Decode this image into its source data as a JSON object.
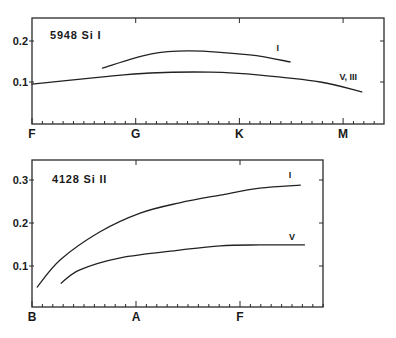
{
  "chart_data": [
    {
      "type": "line",
      "panel": "top",
      "title": "5948 Si I",
      "xlabel": "",
      "ylabel": "",
      "x_categories": [
        "F",
        "G",
        "K",
        "M"
      ],
      "x_minor_ticks_per_interval": 10,
      "xlim": [
        0,
        3.4
      ],
      "ylim": [
        0,
        0.25
      ],
      "y_ticks": [
        0.1,
        0.2
      ],
      "y_tick_labels": [
        "0.1",
        "0.2"
      ],
      "grid": false,
      "series": [
        {
          "name": "I",
          "label_position": {
            "x": 2.37,
            "y": 0.175
          },
          "x": [
            0.68,
            1.14,
            1.52,
            2.1,
            2.49
          ],
          "y": [
            0.134,
            0.168,
            0.176,
            0.166,
            0.149
          ]
        },
        {
          "name": "V, III",
          "label_position": {
            "x": 3.05,
            "y": 0.105
          },
          "x": [
            0.0,
            0.66,
            1.14,
            1.72,
            2.2,
            2.78,
            3.18
          ],
          "y": [
            0.095,
            0.112,
            0.122,
            0.124,
            0.117,
            0.1,
            0.076
          ]
        }
      ]
    },
    {
      "type": "line",
      "panel": "bottom",
      "title": "4128 Si II",
      "xlabel": "",
      "ylabel": "",
      "x_categories": [
        "B",
        "A",
        "F"
      ],
      "x_minor_ticks_per_interval": 10,
      "xlim": [
        0,
        2.83
      ],
      "ylim": [
        0,
        0.345
      ],
      "y_ticks": [
        0.1,
        0.2,
        0.3
      ],
      "y_tick_labels": [
        "0.1",
        "0.2",
        "0.3"
      ],
      "grid": false,
      "series": [
        {
          "name": "I",
          "label_position": {
            "x": 2.48,
            "y": 0.305
          },
          "x": [
            0.05,
            0.27,
            0.65,
            1.04,
            1.42,
            1.81,
            2.19,
            2.58
          ],
          "y": [
            0.051,
            0.114,
            0.179,
            0.223,
            0.247,
            0.265,
            0.281,
            0.288
          ]
        },
        {
          "name": "V",
          "label_position": {
            "x": 2.5,
            "y": 0.16
          },
          "x": [
            0.28,
            0.46,
            0.85,
            1.42,
            1.81,
            2.19,
            2.62
          ],
          "y": [
            0.06,
            0.091,
            0.119,
            0.137,
            0.147,
            0.149,
            0.149
          ]
        }
      ]
    }
  ],
  "panels": {
    "top": {
      "title": "5948 Si I"
    },
    "bottom": {
      "title": "4128 Si II"
    }
  },
  "colors": {
    "ink": "#222222",
    "background": "#ffffff"
  }
}
